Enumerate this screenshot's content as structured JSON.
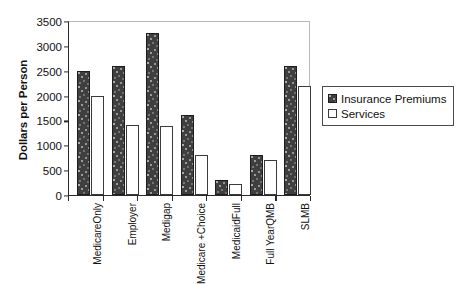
{
  "chart_data": {
    "type": "bar",
    "title": "",
    "subtitle": "",
    "xlabel": "",
    "ylabel": "Dollars per Person",
    "ylim": [
      0,
      3500
    ],
    "yticks": [
      0,
      500,
      1000,
      1500,
      2000,
      2500,
      3000,
      3500
    ],
    "ytick_labels": [
      "0",
      "500",
      "1000",
      "1500",
      "2000",
      "2500",
      "3000",
      "3500"
    ],
    "grid": false,
    "legend_position": "right",
    "categories": [
      "Medicare Only",
      "Employer",
      "Medigap",
      "Medicare + Choice",
      "Full Medicaid",
      "Full Year QMB",
      "SLMB"
    ],
    "category_label_lines": [
      [
        "Medicare",
        "Only"
      ],
      [
        "Employer"
      ],
      [
        "Medigap"
      ],
      [
        "Medicare +",
        "Choice"
      ],
      [
        "Medicaid",
        "Full"
      ],
      [
        "Full Year",
        "QMB"
      ],
      [
        "SLMB"
      ]
    ],
    "series": [
      {
        "name": "Insurance Premiums",
        "color": "#3f3f3f",
        "pattern": "speckled-dark",
        "values": [
          2500,
          2600,
          3250,
          1600,
          300,
          810,
          2600
        ]
      },
      {
        "name": "Services",
        "color": "#ffffff",
        "pattern": "outline-white",
        "values": [
          2000,
          1400,
          1380,
          800,
          220,
          710,
          2200
        ]
      }
    ]
  },
  "legend": {
    "items": [
      {
        "label": "Insurance Premiums",
        "swatch": "premium"
      },
      {
        "label": "Services",
        "swatch": "service"
      }
    ]
  },
  "colors": {
    "axis": "#2a2a2a",
    "text": "#111111",
    "premium_fill": "#3f3f3f",
    "service_fill": "#ffffff",
    "frame_light": "#b9b9b9",
    "background": "#ffffff"
  }
}
